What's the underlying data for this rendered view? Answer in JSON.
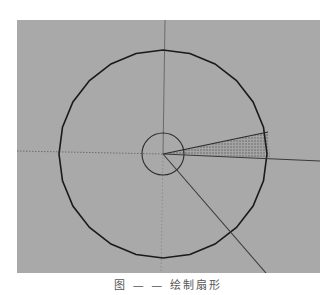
{
  "viewport": {
    "background": "#a9a9a9",
    "origin": {
      "x": 146,
      "y": 134
    },
    "big_circle": {
      "cx": 146,
      "cy": 134,
      "r": 104,
      "segments": 24,
      "stroke": "#1a1a1a"
    },
    "small_circle": {
      "cx": 146,
      "cy": 134,
      "r": 21,
      "stroke": "#2a2a2a"
    },
    "wedge": {
      "points": [
        [
          146,
          134
        ],
        [
          251,
          112
        ],
        [
          253,
          138
        ]
      ],
      "fill": "#8a8a8a",
      "pattern": "dotted"
    },
    "lines": {
      "solid_right": {
        "x1": 146,
        "y1": 134,
        "x2": 303,
        "y2": 141
      },
      "wedge_top_edge": {
        "x1": 146,
        "y1": 134,
        "x2": 251,
        "y2": 112
      },
      "diagonal": {
        "x1": 146,
        "y1": 134,
        "x2": 249,
        "y2": 253
      },
      "vertical_up": {
        "x1": 146,
        "y1": 134,
        "x2": 148,
        "y2": 0
      },
      "dotted_left": {
        "x1": 0,
        "y1": 131,
        "x2": 146,
        "y2": 134
      },
      "dotted_down": {
        "x1": 146,
        "y1": 134,
        "x2": 144,
        "y2": 253
      }
    }
  },
  "caption": {
    "text": "图 — — 绘制扇形"
  }
}
